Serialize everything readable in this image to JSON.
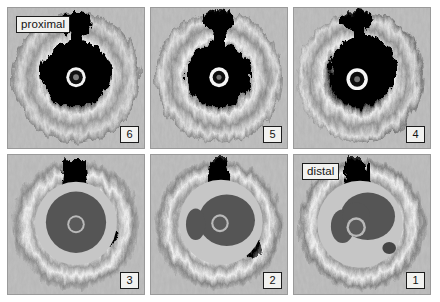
{
  "figure": {
    "background_color": "#ffffff",
    "panel_background_color": "#b5b5b5",
    "label_box_fill": "#f2f2f0",
    "label_box_border": "#1c1c1c",
    "lumen_fill_color": "#555555",
    "vessel_wall_color": "#c6c6c6",
    "catheter_ring_color": "#b9b9b9",
    "catheter_core_color": "#5a5a5a"
  },
  "panels": [
    {
      "id": "panel-6",
      "number": "6",
      "position_label": "proximal",
      "row": 1,
      "column": 1,
      "type": "raw-ultrasound"
    },
    {
      "id": "panel-5",
      "number": "5",
      "position_label": "",
      "row": 1,
      "column": 2,
      "type": "raw-ultrasound"
    },
    {
      "id": "panel-4",
      "number": "4",
      "position_label": "",
      "row": 1,
      "column": 3,
      "type": "raw-ultrasound"
    },
    {
      "id": "panel-3",
      "number": "3",
      "position_label": "",
      "row": 2,
      "column": 1,
      "type": "segmented"
    },
    {
      "id": "panel-2",
      "number": "2",
      "position_label": "",
      "row": 2,
      "column": 2,
      "type": "segmented"
    },
    {
      "id": "panel-1",
      "number": "1",
      "position_label": "distal",
      "row": 2,
      "column": 3,
      "type": "segmented"
    }
  ]
}
